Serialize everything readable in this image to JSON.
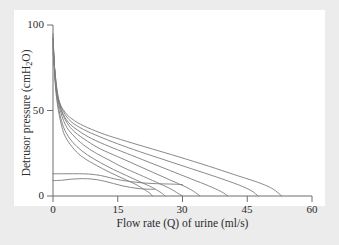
{
  "figure": {
    "background_color": "#ececed",
    "panel_color": "#ffffff",
    "axis_color": "#6e6e6e",
    "curve_color": "#7c7c80",
    "text_color": "#2b2b2b"
  },
  "chart_data": {
    "type": "line",
    "title": "",
    "xlabel_parts": {
      "before": "Flow rate (Q) of urine (ml/s)"
    },
    "xlabel": "Flow rate (Q) of urine (ml/s)",
    "ylabel": "Detrusor pressure (cmH2O)",
    "ylabel_pre": "Detrusor pressure (cmH",
    "ylabel_sub": "2",
    "ylabel_post": "O)",
    "xlim": [
      0,
      60
    ],
    "ylim": [
      0,
      100
    ],
    "xticks": [
      0,
      15,
      30,
      45,
      60
    ],
    "xtick_labels": [
      "0",
      "15",
      "30",
      "45",
      "60"
    ],
    "yticks": [
      0,
      50,
      100
    ],
    "ytick_labels": [
      "0",
      "50",
      "100"
    ],
    "grid": false,
    "legend": null,
    "legend_position": "none",
    "annotations": [],
    "series": [
      {
        "name": "curve-1",
        "points": [
          [
            0,
            95
          ],
          [
            0.4,
            70
          ],
          [
            1,
            54
          ],
          [
            2,
            41
          ],
          [
            3,
            34
          ],
          [
            5,
            27
          ],
          [
            7,
            22.5
          ],
          [
            10,
            18
          ],
          [
            13,
            14
          ],
          [
            16,
            10.5
          ],
          [
            19,
            7
          ],
          [
            21,
            4
          ],
          [
            22.5,
            1.5
          ],
          [
            23,
            0
          ]
        ]
      },
      {
        "name": "curve-2",
        "points": [
          [
            0,
            93
          ],
          [
            0.5,
            68
          ],
          [
            1.2,
            53
          ],
          [
            2.2,
            42
          ],
          [
            3.5,
            35
          ],
          [
            5.5,
            29
          ],
          [
            8,
            24
          ],
          [
            11,
            19.5
          ],
          [
            14,
            15.5
          ],
          [
            17,
            12
          ],
          [
            20,
            8.5
          ],
          [
            23,
            5
          ],
          [
            25,
            2
          ],
          [
            26,
            0
          ]
        ]
      },
      {
        "name": "curve-3",
        "points": [
          [
            0,
            92
          ],
          [
            0.6,
            66
          ],
          [
            1.5,
            52
          ],
          [
            2.8,
            42
          ],
          [
            4.5,
            36
          ],
          [
            7,
            30
          ],
          [
            10,
            25
          ],
          [
            13,
            21
          ],
          [
            16,
            17
          ],
          [
            20,
            12.5
          ],
          [
            24,
            8
          ],
          [
            27,
            4.5
          ],
          [
            29,
            1.5
          ],
          [
            30,
            0
          ]
        ]
      },
      {
        "name": "curve-4",
        "points": [
          [
            0,
            90
          ],
          [
            0.7,
            64
          ],
          [
            1.8,
            51
          ],
          [
            3.2,
            43
          ],
          [
            5,
            37.5
          ],
          [
            8,
            32
          ],
          [
            11,
            27.5
          ],
          [
            15,
            23
          ],
          [
            19,
            18.5
          ],
          [
            23,
            14
          ],
          [
            27,
            9.5
          ],
          [
            31,
            5
          ],
          [
            33,
            2
          ],
          [
            34,
            0
          ]
        ]
      },
      {
        "name": "curve-5",
        "points": [
          [
            0,
            88
          ],
          [
            0.8,
            62
          ],
          [
            2,
            50
          ],
          [
            3.6,
            43
          ],
          [
            6,
            38
          ],
          [
            9,
            33.5
          ],
          [
            13,
            29
          ],
          [
            17,
            25
          ],
          [
            22,
            20
          ],
          [
            27,
            15
          ],
          [
            32,
            10
          ],
          [
            36,
            6
          ],
          [
            39,
            2.5
          ],
          [
            40.5,
            0
          ]
        ]
      },
      {
        "name": "curve-6",
        "points": [
          [
            0,
            86
          ],
          [
            1,
            60
          ],
          [
            2.4,
            49.5
          ],
          [
            4.2,
            43.5
          ],
          [
            7,
            39
          ],
          [
            10.5,
            35
          ],
          [
            15,
            30.5
          ],
          [
            20,
            26
          ],
          [
            26,
            21
          ],
          [
            32,
            16
          ],
          [
            38,
            11
          ],
          [
            43,
            6.5
          ],
          [
            46,
            3
          ],
          [
            47.5,
            0
          ]
        ]
      },
      {
        "name": "curve-7",
        "points": [
          [
            0,
            84
          ],
          [
            1.2,
            58
          ],
          [
            2.8,
            49
          ],
          [
            5,
            44
          ],
          [
            8,
            40
          ],
          [
            12,
            36
          ],
          [
            17,
            32
          ],
          [
            23,
            27.5
          ],
          [
            29,
            23
          ],
          [
            36,
            17.5
          ],
          [
            42,
            12.5
          ],
          [
            48,
            7.5
          ],
          [
            51,
            4
          ],
          [
            53,
            0
          ]
        ]
      },
      {
        "name": "plateau-high",
        "points": [
          [
            0,
            13
          ],
          [
            3,
            13
          ],
          [
            6,
            13
          ],
          [
            8.5,
            12.8
          ],
          [
            11,
            12
          ],
          [
            13,
            10.8
          ],
          [
            15,
            9.6
          ],
          [
            18,
            8.4
          ],
          [
            21,
            7.6
          ],
          [
            24,
            7.2
          ],
          [
            27,
            7
          ],
          [
            29,
            6.8
          ],
          [
            30,
            6.6
          ]
        ]
      },
      {
        "name": "plateau-low",
        "points": [
          [
            0,
            9
          ],
          [
            2,
            9.2
          ],
          [
            4,
            9.8
          ],
          [
            6,
            10.1
          ],
          [
            8,
            10.1
          ],
          [
            10,
            9.6
          ],
          [
            12,
            8.6
          ],
          [
            14,
            7.3
          ],
          [
            16,
            6
          ],
          [
            18,
            5
          ],
          [
            20,
            4.3
          ],
          [
            22,
            4
          ],
          [
            23.5,
            3.9
          ]
        ]
      }
    ]
  },
  "axes": {
    "x_tick_0": "0",
    "x_tick_15": "15",
    "x_tick_30": "30",
    "x_tick_45": "45",
    "x_tick_60": "60",
    "y_tick_0": "0",
    "y_tick_50": "50",
    "y_tick_100": "100",
    "x_title": "Flow rate (Q) of urine (ml/s)"
  }
}
